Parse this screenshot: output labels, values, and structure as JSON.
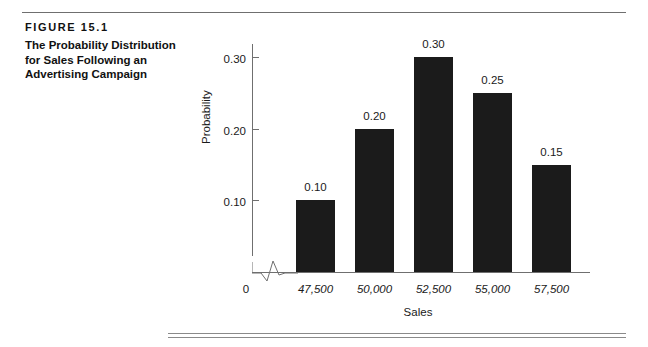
{
  "figure": {
    "number": "FIGURE  15.1",
    "title": "The Probability Distribution for Sales Following an Advertising Campaign"
  },
  "chart_data": {
    "type": "bar",
    "title": "The Probability Distribution for Sales Following an Advertising Campaign",
    "xlabel": "Sales",
    "ylabel": "Probability",
    "categories": [
      "47,500",
      "50,000",
      "52,500",
      "55,000",
      "57,500"
    ],
    "values": [
      0.1,
      0.2,
      0.3,
      0.25,
      0.15
    ],
    "data_labels": [
      "0.10",
      "0.20",
      "0.30",
      "0.25",
      "0.15"
    ],
    "ylim": [
      0,
      0.325
    ],
    "y_ticks": [
      0.1,
      0.2,
      0.3
    ],
    "y_tick_labels": [
      "0.10",
      "0.20",
      "0.30"
    ],
    "grid": false,
    "legend": false,
    "origin_label": "0",
    "axis_break": true,
    "bar_color": "#1b1b1b",
    "axis_color": "#6f6f6f"
  }
}
